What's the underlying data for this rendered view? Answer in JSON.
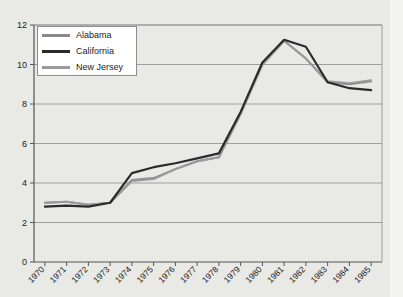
{
  "chart_data": {
    "type": "line",
    "title": "",
    "xlabel": "",
    "ylabel": "",
    "categories": [
      "1970",
      "1971",
      "1972",
      "1973",
      "1974",
      "1975",
      "1976",
      "1977",
      "1978",
      "1979",
      "1980",
      "1981",
      "1982",
      "1983",
      "1984",
      "1985"
    ],
    "ylim": [
      0,
      12
    ],
    "yticks": [
      0,
      2,
      4,
      6,
      8,
      10,
      12
    ],
    "grid": "horizontal",
    "legend_position": "top-left",
    "series": [
      {
        "name": "Alabama",
        "color": "#8a8a8a",
        "values": [
          3.0,
          3.05,
          2.9,
          3.0,
          4.15,
          4.25,
          4.7,
          5.1,
          5.3,
          7.5,
          10.0,
          11.2,
          10.3,
          9.1,
          9.0,
          9.15
        ]
      },
      {
        "name": "California",
        "color": "#2b2b2b",
        "values": [
          2.8,
          2.85,
          2.8,
          3.0,
          4.5,
          4.8,
          5.0,
          5.25,
          5.5,
          7.6,
          10.1,
          11.25,
          10.9,
          9.1,
          8.8,
          8.7
        ]
      },
      {
        "name": "New Jersey",
        "color": "#9a9a9a",
        "values": [
          3.0,
          3.05,
          2.9,
          3.0,
          4.1,
          4.2,
          4.7,
          5.1,
          5.3,
          7.5,
          10.0,
          11.2,
          10.3,
          9.15,
          9.05,
          9.2
        ]
      }
    ]
  },
  "legend": {
    "entries": [
      {
        "label": "Alabama",
        "color": "#8a8a8a"
      },
      {
        "label": "California",
        "color": "#2b2b2b"
      },
      {
        "label": "New Jersey",
        "color": "#9a9a9a"
      }
    ]
  },
  "axes": {
    "y_tick_labels": [
      "0",
      "2",
      "4",
      "6",
      "8",
      "10",
      "12"
    ],
    "x_tick_labels": [
      "1970",
      "1971",
      "1972",
      "1973",
      "1974",
      "1975",
      "1976",
      "1977",
      "1978",
      "1979",
      "1980",
      "1981",
      "1982",
      "1983",
      "1984",
      "1985"
    ]
  }
}
